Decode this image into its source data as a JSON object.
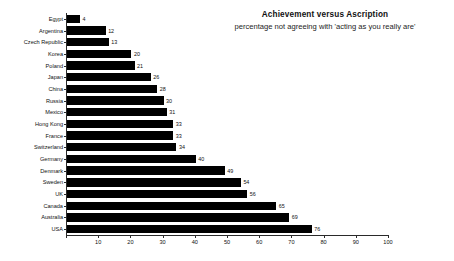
{
  "chart_data": {
    "type": "bar",
    "orientation": "horizontal",
    "title": "Achievement versus Ascription",
    "subtitle": "percentage not agreeing with 'acting as you really are'",
    "xlabel": "",
    "ylabel": "",
    "xlim": [
      0,
      100
    ],
    "xticks": [
      0,
      10,
      20,
      30,
      40,
      50,
      60,
      70,
      80,
      90,
      100
    ],
    "xtick_labels": [
      "",
      "10",
      "20",
      "30",
      "40",
      "50",
      "60",
      "70",
      "80",
      "90",
      "100"
    ],
    "grid": false,
    "legend": false,
    "bar_color": "#000000",
    "categories": [
      "Egypt",
      "Argentina",
      "Czech Republic",
      "Korea",
      "Poland",
      "Japan",
      "China",
      "Russia",
      "Mexico",
      "Hong Kong",
      "France",
      "Switzerland",
      "Germany",
      "Denmark",
      "Sweden",
      "UK",
      "Canada",
      "Australia",
      "USA"
    ],
    "values": [
      4,
      12,
      13,
      20,
      21,
      26,
      28,
      30,
      31,
      33,
      33,
      34,
      40,
      49,
      54,
      56,
      65,
      69,
      76
    ],
    "value_labels": [
      "4",
      "12",
      "13",
      "20",
      "21",
      "26",
      "28",
      "30",
      "31",
      "33",
      "33",
      "34",
      "40",
      "49",
      "54",
      "56",
      "65",
      "69",
      "76"
    ]
  }
}
